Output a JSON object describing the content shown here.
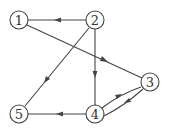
{
  "diagram": {
    "type": "directed-graph",
    "nodes": [
      {
        "id": "1",
        "label": "1",
        "x": 19,
        "y": 20
      },
      {
        "id": "2",
        "label": "2",
        "x": 95,
        "y": 20
      },
      {
        "id": "3",
        "label": "3",
        "x": 150,
        "y": 82
      },
      {
        "id": "4",
        "label": "4",
        "x": 95,
        "y": 114
      },
      {
        "id": "5",
        "label": "5",
        "x": 19,
        "y": 114
      }
    ],
    "edges": [
      {
        "from": "2",
        "to": "1"
      },
      {
        "from": "1",
        "to": "3"
      },
      {
        "from": "2",
        "to": "5"
      },
      {
        "from": "2",
        "to": "4"
      },
      {
        "from": "4",
        "to": "5"
      },
      {
        "from": "4",
        "to": "3"
      },
      {
        "from": "3",
        "to": "4"
      }
    ],
    "colors": {
      "stroke": "#444444",
      "fill": "#ffffff"
    }
  }
}
